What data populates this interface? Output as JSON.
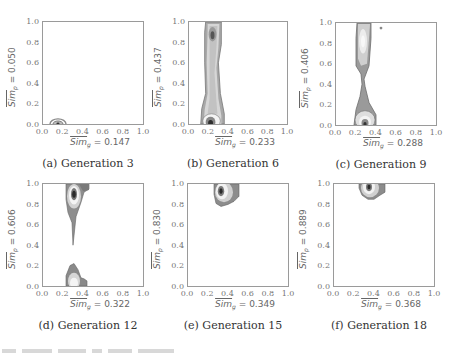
{
  "figure": {
    "panels": [
      {
        "id": "a",
        "caption": "(a) Generation 3",
        "ylabel_prefix": "Sim",
        "ylabel_sub": "p",
        "ylabel_value": " = 0.050",
        "xlabel_prefix": "Sim",
        "xlabel_sub": "g",
        "xlabel_value": " = 0.147"
      },
      {
        "id": "b",
        "caption": "(b) Generation 6",
        "ylabel_prefix": "Sim",
        "ylabel_sub": "p",
        "ylabel_value": " = 0.437",
        "xlabel_prefix": "Sim",
        "xlabel_sub": "g",
        "xlabel_value": " = 0.233"
      },
      {
        "id": "c",
        "caption": "(c) Generation 9",
        "ylabel_prefix": "Sim",
        "ylabel_sub": "p",
        "ylabel_value": " = 0.406",
        "xlabel_prefix": "Sim",
        "xlabel_sub": "g",
        "xlabel_value": " = 0.288"
      },
      {
        "id": "d",
        "caption": "(d) Generation 12",
        "ylabel_prefix": "Sim",
        "ylabel_sub": "p",
        "ylabel_value": " = 0.606",
        "xlabel_prefix": "Sim",
        "xlabel_sub": "g",
        "xlabel_value": " = 0.322"
      },
      {
        "id": "e",
        "caption": "(e) Generation 15",
        "ylabel_prefix": "Sim",
        "ylabel_sub": "p",
        "ylabel_value": " = 0.830",
        "xlabel_prefix": "Sim",
        "xlabel_sub": "g",
        "xlabel_value": " = 0.349"
      },
      {
        "id": "f",
        "caption": "(f) Generation 18",
        "ylabel_prefix": "Sim",
        "ylabel_sub": "p",
        "ylabel_value": " = 0.889",
        "xlabel_prefix": "Sim",
        "xlabel_sub": "g",
        "xlabel_value": " = 0.368"
      }
    ],
    "ticks": [
      "0.0",
      "0.2",
      "0.4",
      "0.6",
      "0.8",
      "1.0"
    ]
  },
  "chart_data": [
    {
      "type": "heatmap",
      "subtype": "density-contour",
      "title": "(a) Generation 3",
      "xlabel": "Sim_g = 0.147",
      "ylabel": "Sim_p = 0.050",
      "xlim": [
        0,
        1
      ],
      "ylim": [
        0,
        1
      ],
      "xticks": [
        0.0,
        0.2,
        0.4,
        0.6,
        0.8,
        1.0
      ],
      "yticks": [
        0.0,
        0.2,
        0.4,
        0.6,
        0.8,
        1.0
      ],
      "grid": false,
      "mean_x": 0.147,
      "mean_y": 0.05,
      "density_peaks": [
        {
          "x": 0.15,
          "y": 0.0
        }
      ]
    },
    {
      "type": "heatmap",
      "subtype": "density-contour",
      "title": "(b) Generation 6",
      "xlabel": "Sim_g = 0.233",
      "ylabel": "Sim_p = 0.437",
      "xlim": [
        0,
        1
      ],
      "ylim": [
        0,
        1
      ],
      "xticks": [
        0.0,
        0.2,
        0.4,
        0.6,
        0.8,
        1.0
      ],
      "yticks": [
        0.0,
        0.2,
        0.4,
        0.6,
        0.8,
        1.0
      ],
      "grid": false,
      "mean_x": 0.233,
      "mean_y": 0.437,
      "density_peaks": [
        {
          "x": 0.22,
          "y": 0.03
        },
        {
          "x": 0.23,
          "y": 0.87
        }
      ]
    },
    {
      "type": "heatmap",
      "subtype": "density-contour",
      "title": "(c) Generation 9",
      "xlabel": "Sim_g = 0.288",
      "ylabel": "Sim_p = 0.406",
      "xlim": [
        0,
        1
      ],
      "ylim": [
        0,
        1
      ],
      "xticks": [
        0.0,
        0.2,
        0.4,
        0.6,
        0.8,
        1.0
      ],
      "yticks": [
        0.0,
        0.2,
        0.4,
        0.6,
        0.8,
        1.0
      ],
      "grid": false,
      "mean_x": 0.288,
      "mean_y": 0.406,
      "density_peaks": [
        {
          "x": 0.29,
          "y": 0.02
        },
        {
          "x": 0.27,
          "y": 0.85
        },
        {
          "x": 0.45,
          "y": 0.95
        }
      ]
    },
    {
      "type": "heatmap",
      "subtype": "density-contour",
      "title": "(d) Generation 12",
      "xlabel": "Sim_g = 0.322",
      "ylabel": "Sim_p = 0.606",
      "xlim": [
        0,
        1
      ],
      "ylim": [
        0,
        1
      ],
      "xticks": [
        0.0,
        0.2,
        0.4,
        0.6,
        0.8,
        1.0
      ],
      "yticks": [
        0.0,
        0.2,
        0.4,
        0.6,
        0.8,
        1.0
      ],
      "grid": false,
      "mean_x": 0.322,
      "mean_y": 0.606,
      "density_peaks": [
        {
          "x": 0.32,
          "y": 0.93
        },
        {
          "x": 0.31,
          "y": 0.05
        }
      ]
    },
    {
      "type": "heatmap",
      "subtype": "density-contour",
      "title": "(e) Generation 15",
      "xlabel": "Sim_g = 0.349",
      "ylabel": "Sim_p = 0.830",
      "xlim": [
        0,
        1
      ],
      "ylim": [
        0,
        1
      ],
      "xticks": [
        0.0,
        0.2,
        0.4,
        0.6,
        0.8,
        1.0
      ],
      "yticks": [
        0.0,
        0.2,
        0.4,
        0.6,
        0.8,
        1.0
      ],
      "grid": false,
      "mean_x": 0.349,
      "mean_y": 0.83,
      "density_peaks": [
        {
          "x": 0.33,
          "y": 0.94
        }
      ]
    },
    {
      "type": "heatmap",
      "subtype": "density-contour",
      "title": "(f) Generation 18",
      "xlabel": "Sim_g = 0.368",
      "ylabel": "Sim_p = 0.889",
      "xlim": [
        0,
        1
      ],
      "ylim": [
        0,
        1
      ],
      "xticks": [
        0.0,
        0.2,
        0.4,
        0.6,
        0.8,
        1.0
      ],
      "yticks": [
        0.0,
        0.2,
        0.4,
        0.6,
        0.8,
        1.0
      ],
      "grid": false,
      "mean_x": 0.368,
      "mean_y": 0.889,
      "density_peaks": [
        {
          "x": 0.36,
          "y": 0.96
        }
      ]
    }
  ]
}
